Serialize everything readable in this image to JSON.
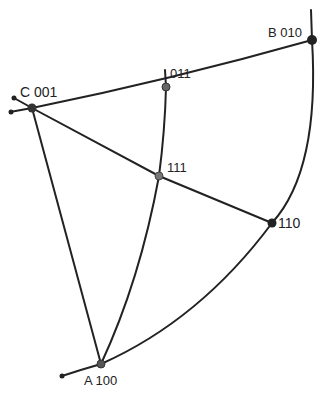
{
  "diagram": {
    "type": "stereographic projection triangle",
    "stroke_color": "#222222",
    "background": "#ffffff",
    "poles": [
      {
        "id": "C",
        "label_letter": "C",
        "label_index": "001",
        "x": 32,
        "y": 108
      },
      {
        "id": "B",
        "label_letter": "B",
        "label_index": "010",
        "x": 312,
        "y": 40
      },
      {
        "id": "011",
        "label_letter": "",
        "label_index": "011",
        "x": 166,
        "y": 87
      },
      {
        "id": "111",
        "label_letter": "",
        "label_index": "111",
        "x": 159,
        "y": 176
      },
      {
        "id": "110",
        "label_letter": "",
        "label_index": "110",
        "x": 272,
        "y": 223
      },
      {
        "id": "A",
        "label_letter": "A",
        "label_index": "100",
        "x": 101,
        "y": 364
      }
    ],
    "labels": {
      "C": "C 001",
      "B": "B 010",
      "p011": "011",
      "p111": "111",
      "p110": "110",
      "A": "A 100"
    }
  }
}
